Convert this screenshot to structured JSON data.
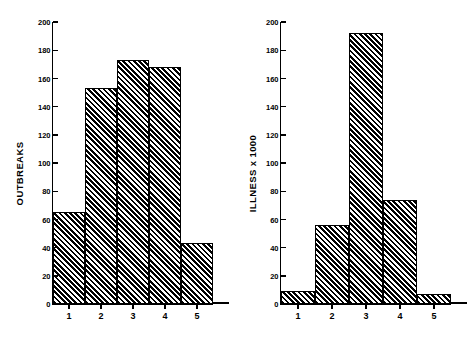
{
  "figure": {
    "background_color": "#ffffff",
    "ink_color": "#000000"
  },
  "panels": [
    {
      "name": "outbreaks-panel",
      "ylabel": "OUTBREAKS",
      "yticks": [
        "0",
        "20",
        "40",
        "60",
        "80",
        "100",
        "120",
        "140",
        "160",
        "180",
        "200"
      ],
      "xticks": [
        "1",
        "2",
        "3",
        "4",
        "5"
      ]
    },
    {
      "name": "illness-panel",
      "ylabel": "ILLNESS x 1000",
      "yticks": [
        "0",
        "20",
        "40",
        "60",
        "80",
        "100",
        "120",
        "140",
        "160",
        "180",
        "200"
      ],
      "xticks": [
        "1",
        "2",
        "3",
        "4",
        "5"
      ]
    }
  ],
  "chart_data": [
    {
      "type": "bar",
      "title": "",
      "xlabel": "",
      "ylabel": "OUTBREAKS",
      "categories": [
        "1",
        "2",
        "3",
        "4",
        "5"
      ],
      "values": [
        65,
        153,
        173,
        168,
        43
      ],
      "ylim": [
        0,
        200
      ],
      "ytick_step": 20,
      "yticks": [
        0,
        20,
        40,
        60,
        80,
        100,
        120,
        140,
        160,
        180,
        200
      ],
      "grid": false,
      "legend": "none",
      "bar_style": "diagonal-hatch-45-black-on-white",
      "bars_contiguous": true
    },
    {
      "type": "bar",
      "title": "",
      "xlabel": "",
      "ylabel": "ILLNESS x 1000",
      "categories": [
        "1",
        "2",
        "3",
        "4",
        "5"
      ],
      "values": [
        9,
        56,
        192,
        74,
        7
      ],
      "ylim": [
        0,
        200
      ],
      "ytick_step": 20,
      "yticks": [
        0,
        20,
        40,
        60,
        80,
        100,
        120,
        140,
        160,
        180,
        200
      ],
      "grid": false,
      "legend": "none",
      "bar_style": "diagonal-hatch-45-black-on-white",
      "bars_contiguous": true
    }
  ]
}
